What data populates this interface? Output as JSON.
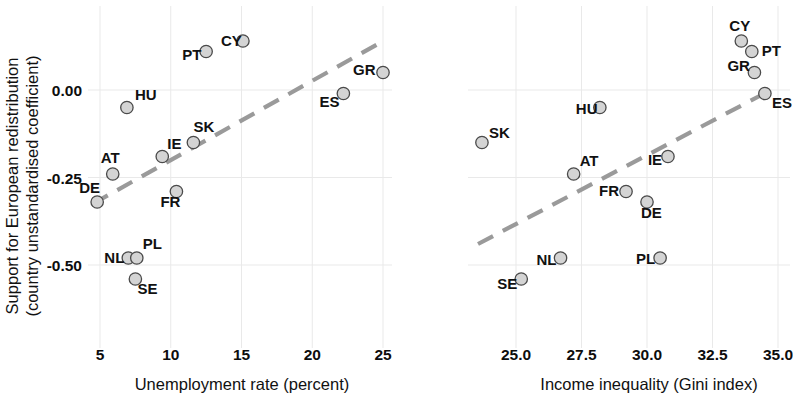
{
  "figure": {
    "type": "scatter-panel-figure",
    "background": "#ffffff",
    "marker_fill": "#d4d4d4",
    "marker_stroke": "#4a4a4a",
    "trendline_color": "#9a9a9a",
    "gridline_color": "#e9e9e9",
    "shared_ylabel_line1": "Support for European redistribution",
    "shared_ylabel_line2": "(country unstandardised coefficient)"
  },
  "chart_data": [
    {
      "type": "scatter",
      "panel": "left",
      "title": "",
      "xlabel": "Unemployment rate (percent)",
      "ylabel": "Support for European redistribution (country unstandardised coefficient)",
      "xlim": [
        3.2,
        26.5
      ],
      "ylim": [
        -0.62,
        0.2
      ],
      "xticks": [
        5,
        10,
        15,
        20,
        25
      ],
      "xtick_labels": [
        "5",
        "10",
        "15",
        "20",
        "25"
      ],
      "yticks": [
        0.0,
        -0.25,
        -0.5
      ],
      "ytick_labels": [
        "0.00",
        "-0.25",
        "-0.50"
      ],
      "grid": true,
      "legend": "none",
      "point_labels": [
        "DE",
        "AT",
        "HU",
        "NL",
        "PL",
        "SE",
        "IE",
        "FR",
        "SK",
        "PT",
        "CY",
        "ES",
        "GR"
      ],
      "x": [
        4.8,
        5.9,
        6.9,
        7.0,
        7.6,
        7.5,
        9.4,
        10.4,
        11.6,
        12.5,
        15.1,
        22.2,
        25.0
      ],
      "y": [
        -0.32,
        -0.24,
        -0.05,
        -0.48,
        -0.48,
        -0.54,
        -0.19,
        -0.29,
        -0.15,
        0.11,
        0.14,
        -0.01,
        0.05
      ],
      "label_offsets": [
        {
          "dx": -18,
          "dy": -9
        },
        {
          "dx": -12,
          "dy": -11
        },
        {
          "dx": 8,
          "dy": -8
        },
        {
          "dx": -24,
          "dy": 5
        },
        {
          "dx": 6,
          "dy": -9
        },
        {
          "dx": 2,
          "dy": 15
        },
        {
          "dx": 5,
          "dy": -8
        },
        {
          "dx": -16,
          "dy": 15
        },
        {
          "dx": 0,
          "dy": -11
        },
        {
          "dx": -24,
          "dy": 8
        },
        {
          "dx": -22,
          "dy": 5
        },
        {
          "dx": -24,
          "dy": 13
        },
        {
          "dx": -30,
          "dy": 2
        }
      ],
      "trendline": {
        "x1": 4.5,
        "y1": -0.325,
        "x2": 24.8,
        "y2": 0.135,
        "style": "dashed"
      }
    },
    {
      "type": "scatter",
      "panel": "right",
      "title": "",
      "xlabel": "Income inequality (Gini index)",
      "ylabel": "Support for European redistribution (country unstandardised coefficient)",
      "xlim": [
        22.6,
        36.0
      ],
      "ylim": [
        -0.62,
        0.2
      ],
      "xticks": [
        25.0,
        27.5,
        30.0,
        32.5,
        35.0
      ],
      "xtick_labels": [
        "25.0",
        "27.5",
        "30.0",
        "32.5",
        "35.0"
      ],
      "yticks": [
        0.0,
        -0.25,
        -0.5
      ],
      "ytick_labels": [
        "0.00",
        "-0.25",
        "-0.50"
      ],
      "grid": true,
      "legend": "none",
      "point_labels": [
        "SK",
        "SE",
        "NL",
        "AT",
        "HU",
        "FR",
        "DE",
        "PL",
        "IE",
        "CY",
        "PT",
        "GR",
        "ES"
      ],
      "x": [
        23.7,
        25.2,
        26.7,
        27.2,
        28.2,
        29.2,
        30.0,
        30.5,
        30.8,
        33.6,
        34.0,
        34.1,
        34.5
      ],
      "y": [
        -0.15,
        -0.54,
        -0.48,
        -0.24,
        -0.05,
        -0.29,
        -0.32,
        -0.48,
        -0.19,
        0.14,
        0.11,
        0.05,
        -0.01
      ],
      "label_offsets": [
        {
          "dx": 7,
          "dy": -5
        },
        {
          "dx": -24,
          "dy": 10
        },
        {
          "dx": -24,
          "dy": 7
        },
        {
          "dx": 6,
          "dy": -8
        },
        {
          "dx": -24,
          "dy": 6
        },
        {
          "dx": -27,
          "dy": 4
        },
        {
          "dx": -6,
          "dy": 16
        },
        {
          "dx": -24,
          "dy": 6
        },
        {
          "dx": -20,
          "dy": 8
        },
        {
          "dx": -12,
          "dy": -10
        },
        {
          "dx": 10,
          "dy": 4
        },
        {
          "dx": -27,
          "dy": -2
        },
        {
          "dx": 7,
          "dy": 14
        }
      ],
      "trendline": {
        "x1": 23.55,
        "y1": -0.44,
        "x2": 34.35,
        "y2": -0.015,
        "style": "dashed"
      }
    }
  ]
}
